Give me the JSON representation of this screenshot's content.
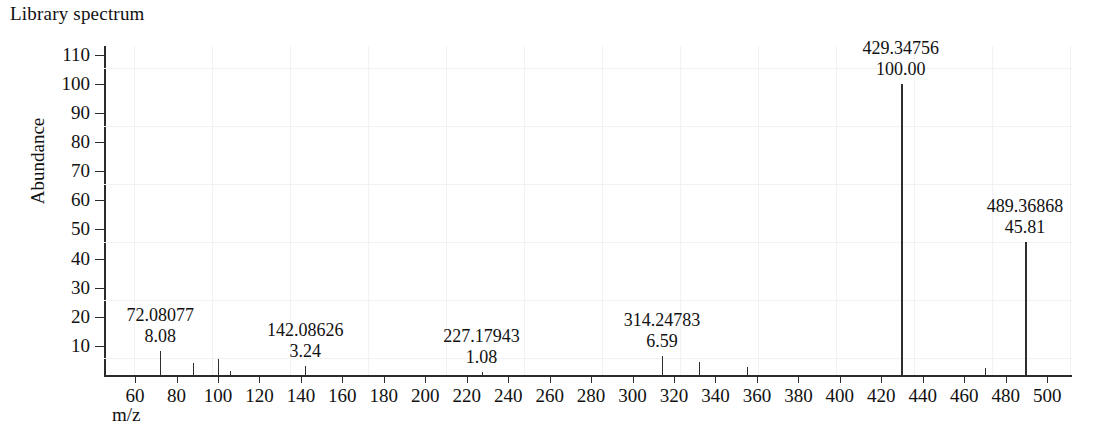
{
  "chart_data": {
    "type": "bar",
    "title": "Library spectrum",
    "xlabel": "m/z",
    "ylabel": "Abundance",
    "xlim": [
      45,
      512
    ],
    "ylim": [
      0,
      113
    ],
    "grid": "faint",
    "legend": "none",
    "x_ticks": [
      60,
      80,
      100,
      120,
      140,
      160,
      180,
      200,
      220,
      240,
      260,
      280,
      300,
      320,
      340,
      360,
      380,
      400,
      420,
      440,
      460,
      480,
      500
    ],
    "y_ticks": [
      10,
      20,
      30,
      40,
      50,
      60,
      70,
      80,
      90,
      100,
      110
    ],
    "series_name": "Library spectrum",
    "x": [
      72.08077,
      88.0,
      100.0,
      106.0,
      142.08626,
      227.17943,
      314.24783,
      332.0,
      355.0,
      429.34756,
      470.0,
      489.36868
    ],
    "values": [
      8.08,
      4.2,
      5.6,
      1.5,
      3.24,
      1.08,
      6.59,
      4.6,
      2.6,
      100.0,
      2.4,
      45.81
    ],
    "peaks": [
      {
        "mz": 72.08077,
        "intensity": 8.08,
        "labeled": true,
        "mz_text": "72.08077",
        "intensity_text": "8.08"
      },
      {
        "mz": 88.0,
        "intensity": 4.2,
        "labeled": false
      },
      {
        "mz": 100.0,
        "intensity": 5.6,
        "labeled": false
      },
      {
        "mz": 106.0,
        "intensity": 1.5,
        "labeled": false
      },
      {
        "mz": 142.08626,
        "intensity": 3.24,
        "labeled": true,
        "mz_text": "142.08626",
        "intensity_text": "3.24"
      },
      {
        "mz": 227.17943,
        "intensity": 1.08,
        "labeled": true,
        "mz_text": "227.17943",
        "intensity_text": "1.08"
      },
      {
        "mz": 314.24783,
        "intensity": 6.59,
        "labeled": true,
        "mz_text": "314.24783",
        "intensity_text": "6.59"
      },
      {
        "mz": 332.0,
        "intensity": 4.6,
        "labeled": false
      },
      {
        "mz": 355.0,
        "intensity": 2.6,
        "labeled": false
      },
      {
        "mz": 429.34756,
        "intensity": 100.0,
        "labeled": true,
        "mz_text": "429.34756",
        "intensity_text": "100.00"
      },
      {
        "mz": 470.0,
        "intensity": 2.4,
        "labeled": false
      },
      {
        "mz": 489.36868,
        "intensity": 45.81,
        "labeled": true,
        "mz_text": "489.36868",
        "intensity_text": "45.81"
      }
    ],
    "annotations": [
      {
        "mz_text": "72.08077",
        "intensity_text": "8.08"
      },
      {
        "mz_text": "142.08626",
        "intensity_text": "3.24"
      },
      {
        "mz_text": "227.17943",
        "intensity_text": "1.08"
      },
      {
        "mz_text": "314.24783",
        "intensity_text": "6.59"
      },
      {
        "mz_text": "429.34756",
        "intensity_text": "100.00"
      },
      {
        "mz_text": "489.36868",
        "intensity_text": "45.81"
      }
    ],
    "colors": {
      "peak": "#2e2e2e",
      "axis": "#2b2b2b",
      "text": "#111111",
      "grid": "#f2f2f4",
      "background": "#ffffff"
    }
  }
}
